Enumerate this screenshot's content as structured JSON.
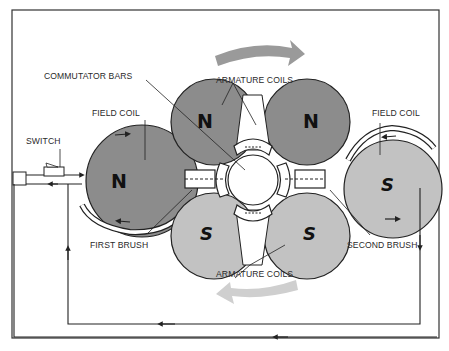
{
  "diagram": {
    "type": "DC motor schematic",
    "labels": {
      "commutator_bars": "COMMUTATOR BARS",
      "armature_coils_top": "ARMATURE COILS",
      "armature_coils_bottom": "ARMATURE COILS",
      "field_coil_left": "FIELD COIL",
      "field_coil_right": "FIELD COIL",
      "switch": "SWITCH",
      "first_brush": "FIRST BRUSH",
      "second_brush": "SECOND BRUSH"
    },
    "poles": {
      "field_left": "N",
      "field_right": "S",
      "armature_top_left": "N",
      "armature_top_right": "N",
      "armature_bottom_left": "S",
      "armature_bottom_right": "S"
    },
    "rotation": {
      "top_arrow_direction": "clockwise",
      "bottom_arrow_direction": "clockwise"
    },
    "colors": {
      "north_fill": "#8c8c8c",
      "south_fill": "#c2c2c2",
      "rotation_arrow_top": "#9a9a9a",
      "rotation_arrow_bottom": "#cfcfcf",
      "line": "#222222"
    }
  }
}
